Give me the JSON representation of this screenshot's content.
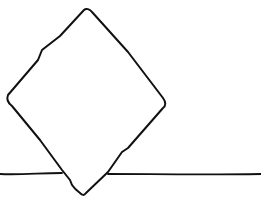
{
  "canvas": {
    "width": 261,
    "height": 199,
    "background": "#ffffff"
  },
  "stroke": {
    "color": "#111111",
    "width": 2
  },
  "shapes": {
    "diamond": {
      "points": "86,10 6,100 84,195 165,105"
    },
    "ground_line_left": {
      "x1": 0,
      "y1": 174,
      "x2": 62,
      "y2": 173
    },
    "ground_line_right": {
      "x1": 108,
      "y1": 174,
      "x2": 261,
      "y2": 174
    }
  }
}
